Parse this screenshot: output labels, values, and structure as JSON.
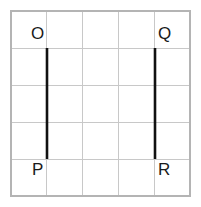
{
  "figure": {
    "background_color": "#ffffff",
    "grid": {
      "columns": 5,
      "rows": 5,
      "left": 11,
      "top": 11,
      "right": 190,
      "bottom": 196,
      "cell_width": 35.8,
      "cell_height": 37,
      "line_color": "#c8c8c8",
      "border_color": "#b4b4b4",
      "x_lines": [
        11,
        46.8,
        82.6,
        118.4,
        154.2,
        190
      ],
      "y_lines": [
        11,
        48,
        85,
        122,
        159,
        196
      ]
    },
    "segments": [
      {
        "name": "OP",
        "color": "#111111",
        "stroke_width": 2.6,
        "x": 47,
        "y_top": 48,
        "y_bottom": 159,
        "endpoint_top": "O",
        "endpoint_bottom": "P"
      },
      {
        "name": "QR",
        "color": "#111111",
        "stroke_width": 2.6,
        "x": 155,
        "y_top": 48,
        "y_bottom": 159,
        "endpoint_top": "Q",
        "endpoint_bottom": "R"
      }
    ],
    "labels": {
      "O": "O",
      "P": "P",
      "Q": "Q",
      "R": "R"
    }
  }
}
